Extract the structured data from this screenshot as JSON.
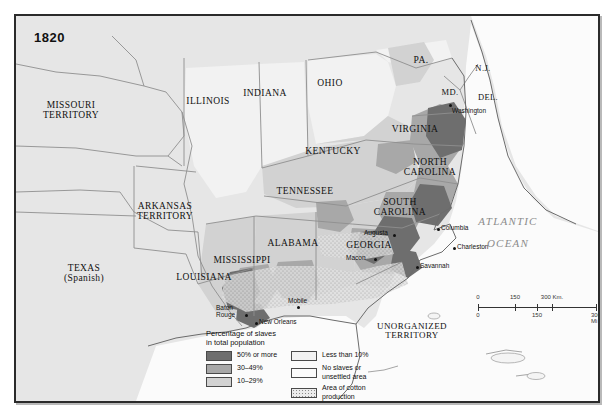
{
  "map": {
    "title": "1820",
    "ocean_label_line1": "ATLANTIC",
    "ocean_label_line2": "OCEAN",
    "accent_color": "#2b2b2b",
    "background_color": "#e6e6e6"
  },
  "regions": [
    {
      "name": "MISSOURI TERRITORY",
      "line1": "MISSOURI",
      "line2": "TERRITORY",
      "x": 55,
      "y": 95,
      "cls": "state"
    },
    {
      "name": "ILLINOIS",
      "line1": "ILLINOIS",
      "line2": "",
      "x": 192,
      "y": 86,
      "cls": "state"
    },
    {
      "name": "INDIANA",
      "line1": "INDIANA",
      "line2": "",
      "x": 249,
      "y": 78,
      "cls": "state"
    },
    {
      "name": "OHIO",
      "line1": "OHIO",
      "line2": "",
      "x": 314,
      "y": 68,
      "cls": "state"
    },
    {
      "name": "PENNSYLVANIA",
      "line1": "PA.",
      "line2": "",
      "x": 405,
      "y": 45,
      "cls": "state"
    },
    {
      "name": "NEW JERSEY",
      "line1": "N.J.",
      "line2": "",
      "x": 467,
      "y": 52,
      "cls": "state2"
    },
    {
      "name": "MARYLAND",
      "line1": "MD.",
      "line2": "",
      "x": 434,
      "y": 76,
      "cls": "state2"
    },
    {
      "name": "DELAWARE",
      "line1": "DEL.",
      "line2": "",
      "x": 472,
      "y": 81,
      "cls": "state2"
    },
    {
      "name": "VIRGINIA",
      "line1": "VIRGINIA",
      "line2": "",
      "x": 399,
      "y": 114,
      "cls": "state"
    },
    {
      "name": "KENTUCKY",
      "line1": "KENTUCKY",
      "line2": "",
      "x": 317,
      "y": 136,
      "cls": "state"
    },
    {
      "name": "TENNESSEE",
      "line1": "TENNESSEE",
      "line2": "",
      "x": 289,
      "y": 176,
      "cls": "state"
    },
    {
      "name": "NORTH CAROLINA",
      "line1": "NORTH",
      "line2": "CAROLINA",
      "x": 414,
      "y": 152,
      "cls": "state"
    },
    {
      "name": "SOUTH CAROLINA",
      "line1": "SOUTH",
      "line2": "CAROLINA",
      "x": 384,
      "y": 192,
      "cls": "state"
    },
    {
      "name": "GEORGIA",
      "line1": "GEORGIA",
      "line2": "",
      "x": 353,
      "y": 230,
      "cls": "state"
    },
    {
      "name": "ALABAMA",
      "line1": "ALABAMA",
      "line2": "",
      "x": 277,
      "y": 228,
      "cls": "state"
    },
    {
      "name": "MISSISSIPPI",
      "line1": "MISSISSIPPI",
      "line2": "",
      "x": 226,
      "y": 245,
      "cls": "state"
    },
    {
      "name": "LOUISIANA",
      "line1": "LOUISIANA",
      "line2": "",
      "x": 188,
      "y": 262,
      "cls": "state"
    },
    {
      "name": "ARKANSAS TERRITORY",
      "line1": "ARKANSAS",
      "line2": "TERRITORY",
      "x": 149,
      "y": 196,
      "cls": "state"
    },
    {
      "name": "TEXAS",
      "line1": "TEXAS",
      "line2": "(Spanish)",
      "x": 68,
      "y": 258,
      "cls": "state"
    },
    {
      "name": "UNORGANIZED TERRITORY",
      "line1": "UNORGANIZED",
      "line2": "TERRITORY",
      "x": 396,
      "y": 315,
      "cls": "terr"
    }
  ],
  "cities": [
    {
      "name": "Washington",
      "label": "Washington",
      "x": 433,
      "y": 88,
      "lx": 436,
      "ly": 91
    },
    {
      "name": "Columbia",
      "label": "Columbia",
      "x": 421,
      "y": 212,
      "lx": 425,
      "ly": 208
    },
    {
      "name": "Charleston",
      "label": "Charleston",
      "x": 437,
      "y": 231,
      "lx": 441,
      "ly": 227
    },
    {
      "name": "Savannah",
      "label": "Savannah",
      "x": 400,
      "y": 250,
      "lx": 404,
      "ly": 246
    },
    {
      "name": "Augusta",
      "label": "Augusta",
      "x": 377,
      "y": 218,
      "lx": 348,
      "ly": 213
    },
    {
      "name": "Macon",
      "label": "Macon",
      "x": 358,
      "y": 242,
      "lx": 330,
      "ly": 238
    },
    {
      "name": "Mobile",
      "label": "Mobile",
      "x": 281,
      "y": 290,
      "lx": 272,
      "ly": 281
    },
    {
      "name": "New Orleans",
      "label": "New Orleans",
      "x": 239,
      "y": 306,
      "lx": 243,
      "ly": 302
    },
    {
      "name": "Baton Rouge",
      "label": "Baton",
      "label2": "Rouge",
      "x": 229,
      "y": 298,
      "lx": 200,
      "ly": 288
    }
  ],
  "legend": {
    "title_line1": "Percentage of slaves",
    "title_line2": "in total population",
    "left_items": [
      {
        "swatch": "c50",
        "label": "50% or more",
        "label2": ""
      },
      {
        "swatch": "c30",
        "label": "30–49%",
        "label2": ""
      },
      {
        "swatch": "c10",
        "label": "10–29%",
        "label2": ""
      }
    ],
    "right_items": [
      {
        "swatch": "clt",
        "label": "Less than 10%",
        "label2": ""
      },
      {
        "swatch": "cno",
        "label": "No slaves or",
        "label2": "unsettled area"
      },
      {
        "swatch": "ccot",
        "label": "Area of cotton",
        "label2": "production"
      }
    ],
    "colors": {
      "50_or_more": "#6e6e6e",
      "30_49": "#a8a8a8",
      "10_29": "#d2d2d2",
      "less_than_10": "#f2f2f2",
      "no_slaves": "#fbfbfb"
    }
  },
  "scale": {
    "km_ticks": [
      "0",
      "150",
      "300 Km."
    ],
    "mi_ticks": [
      "0",
      "150",
      "300 Mi"
    ],
    "km_positions": [
      0,
      37,
      74
    ],
    "mi_positions": [
      0,
      59,
      118
    ]
  }
}
